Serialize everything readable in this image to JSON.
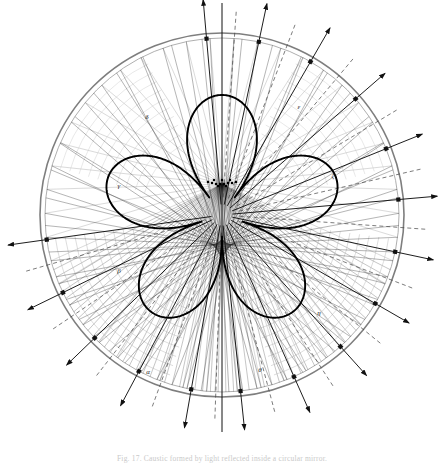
{
  "figure": {
    "caption": "Fig. 17. Caustic formed by light reflected inside a circular mirror.",
    "background_color": "#ffffff",
    "ink_color": "#111111",
    "construction_line_color": "#8a8a8a",
    "dashed_line_color": "#555555"
  },
  "chart_data": {
    "type": "line",
    "xlabel": "",
    "ylabel": "",
    "grid": false,
    "legend_position": "none",
    "circle": {
      "center_x": 222,
      "center_y": 215,
      "radius": 182,
      "inner_radius": 177
    },
    "source_point": {
      "x": 222,
      "y": 184,
      "label": ""
    },
    "sector_labels": [
      {
        "text": "δ",
        "x": 147,
        "y": 117
      },
      {
        "text": "ε",
        "x": 299,
        "y": 107
      },
      {
        "text": "γ",
        "x": 119,
        "y": 186
      },
      {
        "text": "ζ",
        "x": 333,
        "y": 176
      },
      {
        "text": "β",
        "x": 119,
        "y": 271
      },
      {
        "text": "η",
        "x": 319,
        "y": 313
      },
      {
        "text": "α",
        "x": 148,
        "y": 372
      },
      {
        "text": "θ",
        "x": 260,
        "y": 370
      }
    ],
    "incident_ray_count": 46,
    "reflected_ray_count": 46,
    "radial_spoke_angles_deg": [
      -95,
      -78,
      -60,
      -41,
      -22,
      -5,
      12,
      30,
      48,
      66,
      84,
      100,
      118,
      136,
      154,
      172
    ],
    "dashed_bisector_angles_deg": [
      -86,
      -69,
      -50,
      -31,
      -13,
      4,
      21,
      39,
      57,
      75,
      92,
      110,
      128,
      146,
      164
    ],
    "arrow_marker_count": 18,
    "caustic_type": "cardioid-nephroid",
    "cusp_count": 5,
    "axis_of_symmetry": "vertical",
    "xlim": [
      0,
      444
    ],
    "ylim": [
      0,
      464
    ]
  },
  "labels": {
    "alpha": "α",
    "beta": "β",
    "gamma": "γ",
    "delta": "δ",
    "epsilon": "ε",
    "zeta": "ζ",
    "eta": "η",
    "theta": "θ"
  }
}
